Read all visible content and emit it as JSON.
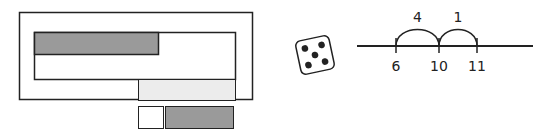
{
  "figure": {
    "colors": {
      "stroke": "#222222",
      "dark_fill": "#9a9a9a",
      "light_fill": "#ececec",
      "white_fill": "#ffffff",
      "die_pip": "#222222"
    }
  },
  "die": {
    "face_value": 5
  },
  "number_line": {
    "ticks": [
      {
        "value": 6,
        "label": "6"
      },
      {
        "value": 10,
        "label": "10"
      },
      {
        "value": 11,
        "label": "11"
      }
    ],
    "jumps": [
      {
        "from": 6,
        "to": 10,
        "label": "4"
      },
      {
        "from": 10,
        "to": 11,
        "label": "1"
      }
    ]
  }
}
